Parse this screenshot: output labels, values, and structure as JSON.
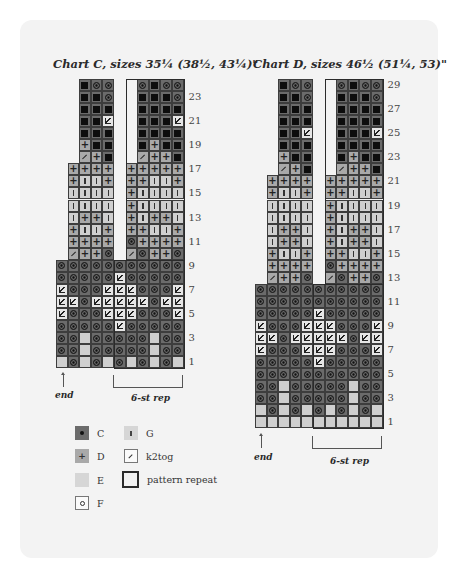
{
  "chart_c": {
    "title": "Chart C, sizes 35¼ (38½, 43¼)\"",
    "row_labels": [
      "23",
      "21",
      "19",
      "17",
      "15",
      "13",
      "11",
      "9",
      "7",
      "5",
      "3",
      "1"
    ],
    "end_label": "end",
    "rep_label": "6-st rep",
    "rows_top_to_bottom": [
      "__BOO__OBOO",
      "__BBO__BBBO",
      "__BBB__BBBB",
      "__BBT__BBBT",
      "__BBB__BBBB",
      "__PBB__BPBB",
      "__KPB__KPPB",
      "_PPPP_PPPPP",
      "_PIIP_PPIIP",
      "_IIII_PIIII",
      "_IIII_PIIII",
      "_IPPI_PIPPI",
      "_PIIP_PPIIP",
      "_PPPP_OPPPP",
      "_KPPO_KOPPO",
      "OOOOOOOOOOO",
      "OOOOOTOOOOO",
      "TOOOTTTOOOT",
      "TTOTTTTTOTT",
      "TOOOTTTOOOT",
      "OOOOOTOOOOO",
      "OOEOOOOOEOO",
      "OOEOOOOOEOO",
      "EOEOEOEOEOE"
    ]
  },
  "chart_d": {
    "title": "Chart D, sizes 46½ (51¼, 53)\"",
    "row_labels": [
      "29",
      "27",
      "25",
      "23",
      "21",
      "19",
      "17",
      "15",
      "13",
      "11",
      "9",
      "7",
      "5",
      "3",
      "1"
    ],
    "end_label": "end",
    "rep_label": "6-st rep",
    "rows_top_to_bottom": [
      "__BOO__OBOO",
      "__BBO__BBBO",
      "__BBB__BBBB",
      "__BBB__BBBB",
      "__BBT__BBBT",
      "__BBB__BBBB",
      "__PBB__BPBB",
      "__KPB__KPPB",
      "_PPPP_PPPPP",
      "_PIIP_PPIIP",
      "_IIII_PIIII",
      "_IIII_PIIII",
      "_IPPI_PIPPI",
      "_IPPI_PIPPI",
      "_PIIP_PPIIP",
      "_PPPP_OPPPP",
      "_KPPO_KOPPO",
      "OOOOOOOOOOO",
      "OOOOOOOOOOO",
      "OOOOOTOOOOO",
      "TOOOTTTOOOT",
      "TTOTTTTTOTT",
      "TOOOTTTOOOT",
      "OOOOOTOOOOO",
      "OOOOOOOOOOO",
      "OOEOOOOOEOO",
      "OOEOOOOOEOO",
      "EOEOEOEOEOE",
      "EEEEEEEEEEE"
    ]
  },
  "symbol_key": {
    "B": "black square on dark (C background)",
    "O": "C (dot)",
    "P": "D (plus)",
    "E": "E (plain light)",
    "I": "G (vertical bar)",
    "K": "k2tog",
    "T": "triangle marker"
  },
  "legend": {
    "items": [
      {
        "key": "C",
        "label": "C",
        "icon": "dot-on-dark-icon"
      },
      {
        "key": "D",
        "label": "D",
        "icon": "plus-icon"
      },
      {
        "key": "E",
        "label": "E",
        "icon": "plain-light-icon"
      },
      {
        "key": "F",
        "label": "F",
        "icon": "small-circle-icon"
      },
      {
        "key": "G",
        "label": "G",
        "icon": "vertical-bar-icon"
      },
      {
        "key": "K",
        "label": "k2tog",
        "icon": "slash-icon"
      },
      {
        "key": "R",
        "label": "pattern repeat",
        "icon": "outlined-box-icon"
      }
    ]
  },
  "colors": {
    "card_bg": "#f3f3f3",
    "dark_cell": "#6b6b6b",
    "mid_cell": "#a9a9a9",
    "light_cell": "#cfcfcf",
    "grid_line": "#3d3d3d"
  }
}
